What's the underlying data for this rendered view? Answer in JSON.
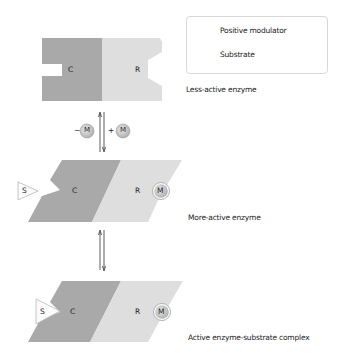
{
  "legend": {
    "items": [
      {
        "icon": "positive-modulator-icon",
        "label": "Positive modulator"
      },
      {
        "icon": "substrate-icon",
        "label": "Substrate"
      }
    ]
  },
  "states": [
    {
      "label": "Less-active enzyme",
      "catalytic": "C",
      "regulatory": "R"
    },
    {
      "label": "More-active enzyme",
      "catalytic": "C",
      "regulatory": "R",
      "modulator": "M",
      "substrate": "S"
    },
    {
      "label": "Active enzyme-substrate complex",
      "catalytic": "C",
      "regulatory": "R",
      "modulator": "M",
      "substrate": "S"
    }
  ],
  "transition1": {
    "minus": "−",
    "plus": "+",
    "modulator": "M"
  },
  "colors": {
    "catalytic": "#a9a9a9",
    "regulatory": "#dedede",
    "modulator_fill": "#c8c8c8",
    "outline": "#b0b0b0"
  }
}
